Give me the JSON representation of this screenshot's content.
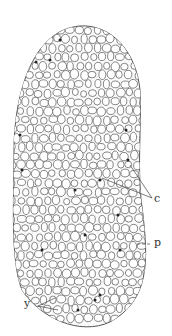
{
  "figure": {
    "labels": {
      "c": "c",
      "p": "p",
      "y": "y"
    },
    "colors": {
      "outline": "#555555",
      "stipple": "#b8b8b8",
      "vesicle": "#ffffff",
      "granule": "#222222"
    }
  }
}
